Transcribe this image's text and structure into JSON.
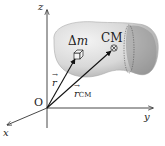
{
  "diagram": {
    "type": "center-of-mass-vector-diagram",
    "axes": {
      "x": "x",
      "y": "y",
      "z": "z"
    },
    "origin_label": "O",
    "mass_element": {
      "symbol": "Δ",
      "var": "m"
    },
    "center_of_mass": "CM",
    "vectors": {
      "r": {
        "symbol": "r",
        "arrow": "→"
      },
      "r_cm": {
        "symbol": "r",
        "arrow": "→",
        "subscript": "CM"
      }
    },
    "colors": {
      "axis": "#333333",
      "body_light": "#e6e6e6",
      "body_dark": "#9a9a9a",
      "vector": "#111111"
    }
  }
}
